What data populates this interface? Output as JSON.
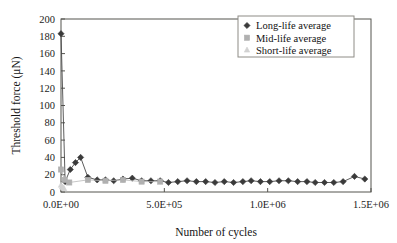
{
  "chart_data": {
    "type": "line",
    "title": "",
    "xlabel": "Number of cycles",
    "ylabel": "Threshold force (μN)",
    "xlim": [
      0,
      1500000
    ],
    "ylim": [
      0,
      200
    ],
    "grid": false,
    "legend_position": "top-right",
    "xticks": [
      0,
      500000,
      1000000,
      1500000
    ],
    "xtick_labels": [
      "0.0E+00",
      "5.0E+05",
      "1.0E+06",
      "1.5E+06"
    ],
    "yticks": [
      0,
      20,
      40,
      60,
      80,
      100,
      120,
      140,
      160,
      180,
      200
    ],
    "ytick_labels": [
      "0",
      "20",
      "40",
      "60",
      "80",
      "100",
      "120",
      "140",
      "160",
      "180",
      "200"
    ],
    "series": [
      {
        "name": "Long-life average",
        "marker": "diamond",
        "color": "#3a3a3a",
        "x": [
          0,
          20000,
          45000,
          70000,
          95000,
          130000,
          175000,
          215000,
          255000,
          300000,
          345000,
          390000,
          435000,
          480000,
          520000,
          565000,
          610000,
          655000,
          700000,
          745000,
          790000,
          835000,
          880000,
          920000,
          965000,
          1010000,
          1055000,
          1100000,
          1145000,
          1190000,
          1230000,
          1275000,
          1320000,
          1365000,
          1420000,
          1470000
        ],
        "y": [
          183,
          12,
          26,
          34,
          40,
          17,
          14,
          14,
          13,
          15,
          16,
          13,
          13,
          13,
          11,
          12,
          13,
          12,
          12,
          11,
          12,
          11,
          12,
          13,
          12,
          12,
          13,
          13,
          12,
          12,
          11,
          11,
          11,
          12,
          18,
          15
        ]
      },
      {
        "name": "Mid-life average",
        "marker": "square",
        "color": "#b0b0b0",
        "x": [
          0,
          18000,
          40000,
          130000,
          215000,
          300000,
          390000,
          480000
        ],
        "y": [
          26,
          14,
          11,
          14,
          13,
          14,
          12,
          12
        ]
      },
      {
        "name": "Short-life average",
        "marker": "triangle",
        "color": "#d2d2d2",
        "x": [
          0,
          5000,
          10000,
          15000
        ],
        "y": [
          8,
          6,
          5,
          4
        ]
      }
    ]
  },
  "legend": {
    "entries": [
      {
        "label": "Long-life average"
      },
      {
        "label": "Mid-life average"
      },
      {
        "label": "Short-life average"
      }
    ]
  }
}
